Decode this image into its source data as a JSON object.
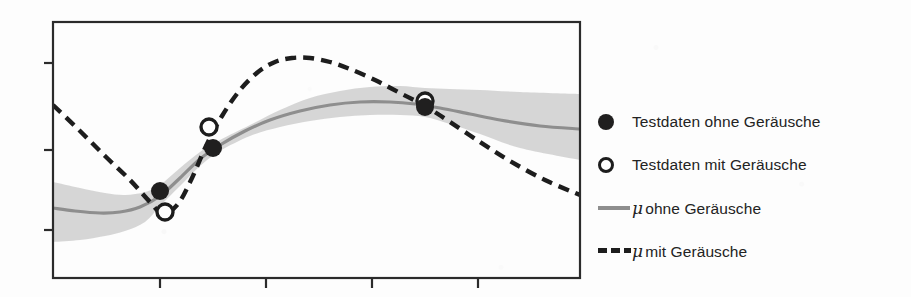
{
  "figure": {
    "type": "line-chart-with-confidence-band",
    "background_color": "#fdfdfd",
    "axis_color": "#2b2b2b"
  },
  "legend": {
    "position": "right",
    "items": [
      {
        "marker": "filled-circle",
        "marker_icon": "filled-circle-icon",
        "color": "#201f1f",
        "label": "Testdaten ohne Geräusche"
      },
      {
        "marker": "open-circle",
        "marker_icon": "open-circle-icon",
        "color": "#1d1d1d",
        "label": "Testdaten mit Geräusche"
      },
      {
        "marker": "solid-line",
        "marker_icon": "solid-line-icon",
        "color": "#8e8e8e",
        "mu": "μ",
        "label": "ohne Geräusche"
      },
      {
        "marker": "dashed-line",
        "marker_icon": "dashed-line-icon",
        "color": "#1d1d1d",
        "mu": "μ",
        "label": "mit Geräusche"
      }
    ]
  },
  "chart_data": {
    "type": "line",
    "title": "",
    "xlabel": "",
    "ylabel": "",
    "grid": false,
    "legend_position": "right",
    "xlim": [
      0,
      10
    ],
    "ylim": [
      0,
      10
    ],
    "axis": {
      "y_ticks_px": [
        63,
        150,
        230
      ],
      "x_ticks_px": [
        160,
        266,
        372,
        478
      ],
      "frame_px": {
        "left": 53,
        "top": 22,
        "right": 580,
        "bottom": 278
      }
    },
    "series": [
      {
        "name": "μ ohne Geräusche",
        "style": "solid",
        "color": "#8e8e8e",
        "points_px": [
          [
            53,
            208
          ],
          [
            75,
            211
          ],
          [
            100,
            213
          ],
          [
            120,
            212
          ],
          [
            140,
            207
          ],
          [
            160,
            196
          ],
          [
            180,
            178
          ],
          [
            200,
            159
          ],
          [
            220,
            145
          ],
          [
            245,
            131
          ],
          [
            270,
            120
          ],
          [
            300,
            111
          ],
          [
            330,
            105
          ],
          [
            360,
            102
          ],
          [
            390,
            102
          ],
          [
            415,
            104
          ],
          [
            440,
            108
          ],
          [
            470,
            114
          ],
          [
            500,
            120
          ],
          [
            540,
            126
          ],
          [
            580,
            129
          ]
        ]
      },
      {
        "name": "μ mit Geräusche",
        "style": "dashed",
        "color": "#1d1d1d",
        "points_px": [
          [
            53,
            105
          ],
          [
            80,
            131
          ],
          [
            105,
            156
          ],
          [
            130,
            180
          ],
          [
            150,
            202
          ],
          [
            163,
            214
          ],
          [
            178,
            204
          ],
          [
            192,
            178
          ],
          [
            206,
            146
          ],
          [
            222,
            116
          ],
          [
            240,
            90
          ],
          [
            258,
            72
          ],
          [
            275,
            62
          ],
          [
            292,
            58
          ],
          [
            310,
            58
          ],
          [
            330,
            62
          ],
          [
            350,
            69
          ],
          [
            375,
            80
          ],
          [
            400,
            93
          ],
          [
            425,
            106
          ],
          [
            450,
            122
          ],
          [
            480,
            142
          ],
          [
            510,
            161
          ],
          [
            545,
            180
          ],
          [
            580,
            195
          ]
        ]
      }
    ],
    "confidence_band": {
      "name": "Unsicherheitsband",
      "color": "#d2d2d2",
      "upper_px": [
        [
          53,
          182
        ],
        [
          80,
          188
        ],
        [
          105,
          193
        ],
        [
          125,
          195
        ],
        [
          145,
          192
        ],
        [
          160,
          185
        ],
        [
          180,
          168
        ],
        [
          200,
          152
        ],
        [
          220,
          140
        ],
        [
          250,
          125
        ],
        [
          280,
          110
        ],
        [
          310,
          98
        ],
        [
          340,
          91
        ],
        [
          370,
          87
        ],
        [
          400,
          86
        ],
        [
          425,
          88
        ],
        [
          450,
          89
        ],
        [
          480,
          90
        ],
        [
          520,
          92
        ],
        [
          580,
          94
        ]
      ],
      "lower_px": [
        [
          53,
          242
        ],
        [
          80,
          240
        ],
        [
          105,
          236
        ],
        [
          125,
          231
        ],
        [
          145,
          222
        ],
        [
          160,
          206
        ],
        [
          180,
          186
        ],
        [
          200,
          166
        ],
        [
          220,
          151
        ],
        [
          250,
          136
        ],
        [
          280,
          127
        ],
        [
          310,
          121
        ],
        [
          340,
          117
        ],
        [
          370,
          115
        ],
        [
          400,
          115
        ],
        [
          425,
          117
        ],
        [
          450,
          124
        ],
        [
          480,
          134
        ],
        [
          520,
          148
        ],
        [
          580,
          160
        ]
      ]
    },
    "points": [
      {
        "name": "Testdaten ohne Geräusche",
        "marker": "filled-circle",
        "color": "#201f1f",
        "coords_px": [
          [
            160,
            191
          ],
          [
            213,
            148
          ],
          [
            425,
            107
          ]
        ]
      },
      {
        "name": "Testdaten mit Geräusche",
        "marker": "open-circle",
        "color": "#1d1d1d",
        "coords_px": [
          [
            165,
            212
          ],
          [
            209,
            127
          ],
          [
            425,
            101
          ]
        ]
      }
    ]
  }
}
